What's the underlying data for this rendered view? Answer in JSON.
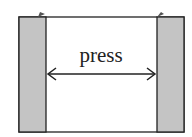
{
  "diagram": {
    "label": "press",
    "colors": {
      "plate_fill": "#c4c4c4",
      "stroke": "#222222",
      "background": "#ffffff"
    }
  }
}
